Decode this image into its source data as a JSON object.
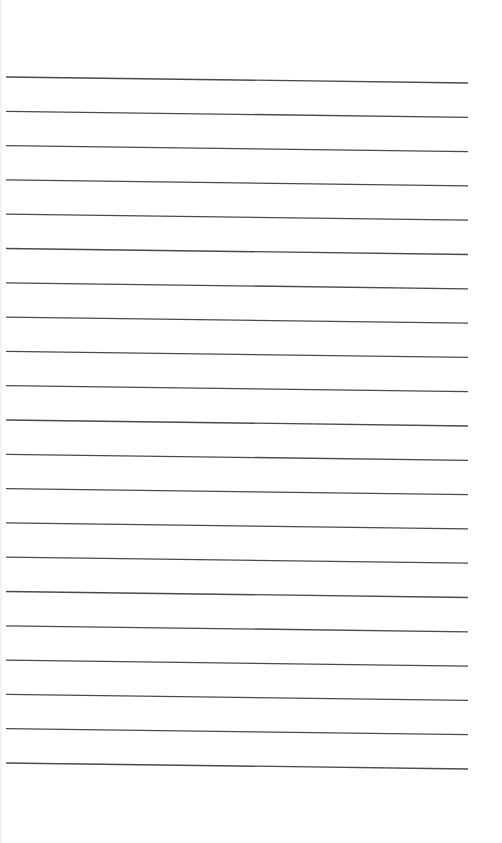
{
  "page": {
    "type": "lined-paper",
    "background": "#ffffff",
    "line_color": "#4a4a4a",
    "line_count": 21,
    "first_line_y_left": 77,
    "first_line_y_right": 83,
    "line_spacing": 34.3,
    "line_x_start": 6,
    "line_x_end": 468,
    "text": ""
  }
}
